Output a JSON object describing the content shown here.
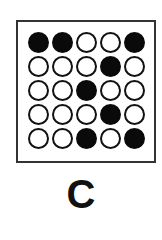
{
  "figure": {
    "label": "C",
    "grid": {
      "rows": 5,
      "cols": 5,
      "cells": [
        [
          1,
          1,
          0,
          0,
          1
        ],
        [
          0,
          0,
          0,
          1,
          0
        ],
        [
          0,
          0,
          1,
          0,
          0
        ],
        [
          0,
          0,
          0,
          1,
          0
        ],
        [
          0,
          0,
          1,
          0,
          1
        ]
      ],
      "filled_color": "#0a0a0a",
      "empty_color": "#ffffff",
      "outline_color": "#111111"
    },
    "border_color": "#333333"
  }
}
